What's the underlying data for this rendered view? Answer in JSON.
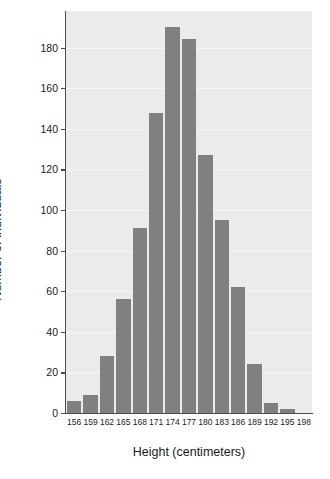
{
  "chart_data": {
    "type": "bar",
    "title": "",
    "subtitle": "",
    "xlabel": "Height (centimeters)",
    "ylabel": "Number of individuals",
    "categories": [
      "156",
      "159",
      "162",
      "165",
      "168",
      "171",
      "174",
      "177",
      "180",
      "183",
      "186",
      "189",
      "192",
      "195",
      "198"
    ],
    "values": [
      6,
      9,
      28,
      56,
      91,
      148,
      190,
      184,
      127,
      95,
      62,
      24,
      5,
      2,
      0
    ],
    "ylim": [
      0,
      198
    ],
    "ytick_values": [
      0,
      20,
      40,
      60,
      80,
      100,
      120,
      140,
      160,
      180
    ],
    "ytick_labels": [
      "0",
      "20",
      "40",
      "60",
      "80",
      "100",
      "120",
      "140",
      "160",
      "180"
    ],
    "xtick_labels": [
      "156",
      "159",
      "162",
      "165",
      "168",
      "171",
      "174",
      "177",
      "180",
      "183",
      "186",
      "189",
      "192",
      "195",
      "198"
    ],
    "grid": true,
    "grid_axis": "y",
    "legend": null,
    "legend_position": "none",
    "bar_color": "#808080",
    "plot_background": "#ebebeb",
    "gridline_color": "#f7f7f7",
    "axis_color": "#4d4d4d",
    "figure_background": "#ffffff",
    "bin_width_cm": 3,
    "annotations": []
  }
}
